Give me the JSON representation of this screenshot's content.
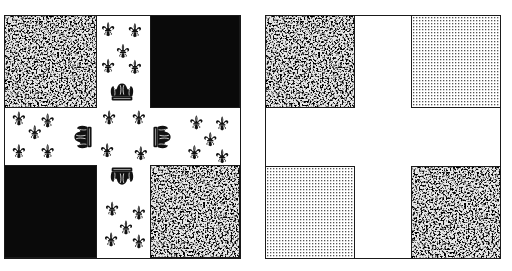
{
  "figure": {
    "left_flag": {
      "description": "Quartered flag with white cross charged with fleurs-de-lis and crowns",
      "quadrants": {
        "top_left": "granite-texture",
        "top_right": "solid-black",
        "bottom_left": "solid-black",
        "bottom_right": "granite-texture"
      },
      "cross": {
        "color": "#ffffff",
        "arms": {
          "top": {
            "fleurs_de_lis": 5,
            "crown": 1
          },
          "left": {
            "fleurs_de_lis": 5,
            "crown": 1
          },
          "right": {
            "fleurs_de_lis": 5,
            "crown": 1
          },
          "bottom": {
            "fleurs_de_lis": 5,
            "crown": 1
          }
        },
        "center": {
          "fleurs_de_lis": 4
        }
      }
    },
    "right_flag": {
      "description": "Plain quartered flag with white cross",
      "quadrants": {
        "top_left": "granite-texture",
        "top_right": "dotted-texture",
        "bottom_left": "dotted-texture",
        "bottom_right": "granite-texture"
      },
      "cross": {
        "color": "#ffffff"
      }
    }
  },
  "colors": {
    "outline": "#1a1a1a",
    "black": "#0a0a0a",
    "white": "#ffffff",
    "granite_dark": "#2a2a2a",
    "granite_light": "#e8e8e8",
    "dot": "#555555"
  }
}
